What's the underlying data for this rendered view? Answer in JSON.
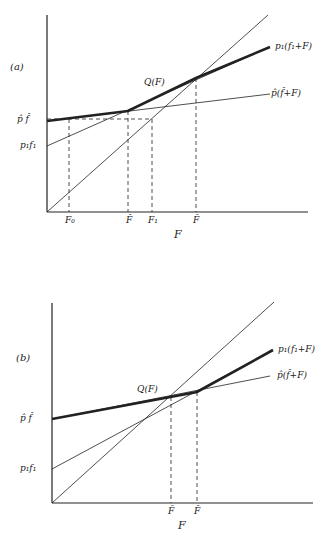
{
  "panels": [
    {
      "id": "a",
      "tag": "(a)",
      "axes": {
        "xlabel": "F"
      },
      "y_labels": {
        "p_hat_f_hat": "p̂ f̂",
        "p1f1": "p₁f₁"
      },
      "x_ticks": {
        "F0": "F₀",
        "F_hat": "F̂",
        "F1": "F₁",
        "F_bar": "F̄"
      },
      "curves": {
        "Q": "Q(F)",
        "p1_line": "p₁(f₁+F)",
        "p_hat_line": "p̂(f̂+F)"
      }
    },
    {
      "id": "b",
      "tag": "(b)",
      "axes": {
        "xlabel": "F"
      },
      "y_labels": {
        "p_hat_f_hat": "p̂ f̂",
        "p1f1": "p₁f₁"
      },
      "x_ticks": {
        "F_bar": "F̄",
        "F_hat": "F̂"
      },
      "curves": {
        "Q": "Q(F)",
        "p1_line": "p₁(f₁+F)",
        "p_hat_line": "p̂(f̂+F)"
      }
    }
  ],
  "colors": {
    "ink": "#222222",
    "background": "#ffffff"
  }
}
